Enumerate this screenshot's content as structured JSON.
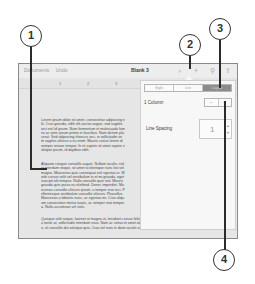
{
  "toolbar": {
    "documents_label": "Documents",
    "undo_label": "Undo",
    "title": "Blank 3",
    "icons": [
      "format-brush-icon",
      "plus-icon",
      "wrench-icon",
      "share-icon"
    ],
    "icon_glyphs": [
      "⌕",
      "+",
      "⚲",
      "⇧"
    ]
  },
  "ruler": {
    "marks": [
      "1",
      "2",
      "3",
      "4"
    ]
  },
  "document": {
    "paragraphs": [
      "Lorem ipsum dolor sit amet, consectetur adipiscing elit. Cras gravida, nibh elit auctor augue, sed sagittis orci nisl id ipsum. Nam fermentum et malesuada fames ac ante ipsum primis in faucibus. Nam dictum placerat. Sed adipiscing rhoncus orci, in sollicitudin sem sagittis ultrices a eu enim. Mauris varius lorem id semper ornare tempor. In et sapien sit amet sapien volutpat ipsum, id dapibus nibh.",
      "Aliquam congue convallis augue. Nullam iaculis, nisl at interdum neque, sit amet scelerisque nunc leo vel magna. Maecenas quis consequat nisl egestas in. Morbi cursus velit vel vestibulum in et mi gravida, eget suscipit elit tempus. Nulla convallis quis nisl. Mauris gravida quis purus eu eleifend. Donec imperdiet. Maecenas convallis ultrices ipsum, a tempor erat orci. Pellentesque vestibulum convallis ultrices. Phasellus Maecenas a lobortis nunc, ac egestas mi. Cras aliquam consectetur metus turpis, ac semper erat tempor a. Nulla accumsan vel eros.",
      "Quisque velit neque, laoreet at magna ut, tincidunt cursus felis vel sapien egestas pulvinar. Phasellus iaculis eu tortor at, sollicitudin interdum risus. Nam ac netus et amet odio faucibus venenatis. Nullam viverra tortor ante, et convallis dui volutpat quis. Cras vel eros in diam iaculis suscipit."
    ]
  },
  "popover": {
    "tabs": [
      {
        "label": "Style",
        "active": false
      },
      {
        "label": "List",
        "active": false
      },
      {
        "label": "Layout",
        "active": true
      }
    ],
    "columns": {
      "label": "1 Column",
      "decrement": "−",
      "increment": "+"
    },
    "line_spacing": {
      "label": "Line Spacing",
      "value": "1",
      "arrows": "▲\n▼"
    }
  },
  "callouts": [
    "1",
    "2",
    "3",
    "4"
  ],
  "colors": {
    "active_tab": "#8c8c8c",
    "screen_bg": "#e6e6e6",
    "popover_bg": "#f7f7f7",
    "callout_stroke": "#333333"
  }
}
